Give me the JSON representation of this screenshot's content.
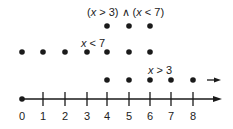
{
  "title_label": {
    "parts": [
      "(",
      "x",
      " > 3) ∧ (",
      "x",
      " < 7)"
    ]
  },
  "row_lt7_label": {
    "var": "x",
    "rest": " < 7"
  },
  "row_gt3_label": {
    "var": "x",
    "rest": " > 3"
  },
  "axis": {
    "ticks": [
      "0",
      "1",
      "2",
      "3",
      "4",
      "5",
      "6",
      "7",
      "8"
    ],
    "tick_x": [
      22,
      43,
      65,
      87,
      107,
      129,
      150,
      171,
      193
    ],
    "start_dot_value": 0
  },
  "rows": {
    "intersection": [
      4,
      5,
      6
    ],
    "x_lt_7": [
      0,
      1,
      2,
      3,
      4,
      5,
      6
    ],
    "x_gt_3": [
      4,
      5,
      6,
      7,
      8
    ],
    "x_gt_3_continues": true
  },
  "colors": {
    "ink": "#1a1a1a"
  }
}
